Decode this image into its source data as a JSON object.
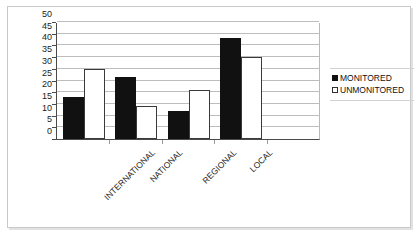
{
  "chart_data": {
    "type": "bar",
    "title": "",
    "xlabel": "",
    "ylabel": "",
    "categories": [
      "INTERNATIONAL",
      "NATIONAL",
      "REGIONAL",
      "LOCAL"
    ],
    "series": [
      {
        "name": "MONITORED",
        "color": "#111111",
        "values": [
          18,
          26.5,
          12,
          43
        ]
      },
      {
        "name": "UNMONITORED",
        "color": "#ffffff",
        "values": [
          30,
          14,
          21,
          35
        ]
      }
    ],
    "ylim": [
      0,
      50
    ],
    "ytick_values": [
      0,
      5,
      10,
      15,
      20,
      25,
      30,
      35,
      40,
      45,
      50
    ],
    "ytick_labels": [
      "0",
      "5",
      "10",
      "15",
      "20",
      "25",
      "30",
      "35",
      "40",
      "45",
      "50"
    ],
    "grid": true,
    "grid_axis": "y",
    "legend_position": "right",
    "xtick_rotation": -45,
    "empty_trailing_slot": true
  },
  "legend": {
    "items": [
      {
        "label": "MONITORED",
        "marker": "filled-square-icon"
      },
      {
        "label": "UNMONITORED",
        "marker": "hollow-square-icon"
      }
    ]
  }
}
